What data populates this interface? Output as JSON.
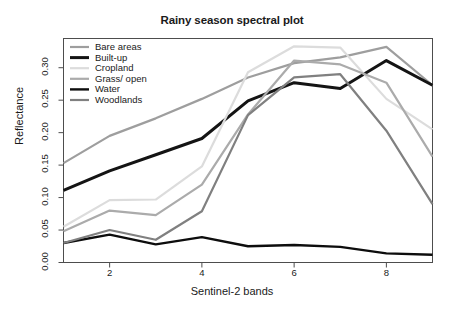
{
  "chart_data": {
    "type": "line",
    "title": "Rainy season spectral plot",
    "xlabel": "Sentinel-2 bands",
    "ylabel": "Reflectance",
    "x": [
      1,
      2,
      3,
      4,
      5,
      6,
      7,
      8,
      9
    ],
    "xlim": [
      1,
      9
    ],
    "ylim": [
      0.0,
      0.345
    ],
    "xticks": [
      2,
      4,
      6,
      8
    ],
    "xtick_labels": [
      "2",
      "4",
      "6",
      "8"
    ],
    "yticks": [
      0.0,
      0.05,
      0.1,
      0.15,
      0.2,
      0.25,
      0.3
    ],
    "ytick_labels": [
      "0.00",
      "0.05",
      "0.10",
      "0.15",
      "0.20",
      "0.25",
      "0.30"
    ],
    "grid": false,
    "legend_position": "top-left",
    "frame": true,
    "series": [
      {
        "name": "Bare areas",
        "color": "#9e9e9e",
        "width": 2.2,
        "values": [
          0.153,
          0.195,
          0.222,
          0.252,
          0.285,
          0.307,
          0.316,
          0.332,
          0.273
        ]
      },
      {
        "name": "Built-up",
        "color": "#141414",
        "width": 3.0,
        "values": [
          0.111,
          0.141,
          0.166,
          0.191,
          0.249,
          0.277,
          0.268,
          0.311,
          0.273
        ]
      },
      {
        "name": "Cropland",
        "color": "#dcdcdc",
        "width": 2.2,
        "values": [
          0.055,
          0.096,
          0.097,
          0.148,
          0.293,
          0.333,
          0.331,
          0.252,
          0.205
        ]
      },
      {
        "name": "Grass/ open",
        "color": "#ababab",
        "width": 2.2,
        "values": [
          0.048,
          0.08,
          0.073,
          0.12,
          0.228,
          0.311,
          0.305,
          0.277,
          0.163
        ]
      },
      {
        "name": "Water",
        "color": "#0d0d0d",
        "width": 2.4,
        "values": [
          0.03,
          0.043,
          0.028,
          0.039,
          0.025,
          0.027,
          0.024,
          0.014,
          0.012
        ]
      },
      {
        "name": "Woodlands",
        "color": "#808080",
        "width": 2.2,
        "values": [
          0.03,
          0.05,
          0.035,
          0.079,
          0.227,
          0.285,
          0.29,
          0.203,
          0.09
        ]
      }
    ]
  },
  "legend": {
    "entries": [
      {
        "label": "Bare areas"
      },
      {
        "label": "Built-up"
      },
      {
        "label": "Cropland"
      },
      {
        "label": "Grass/ open"
      },
      {
        "label": "Water"
      },
      {
        "label": "Woodlands"
      }
    ]
  }
}
